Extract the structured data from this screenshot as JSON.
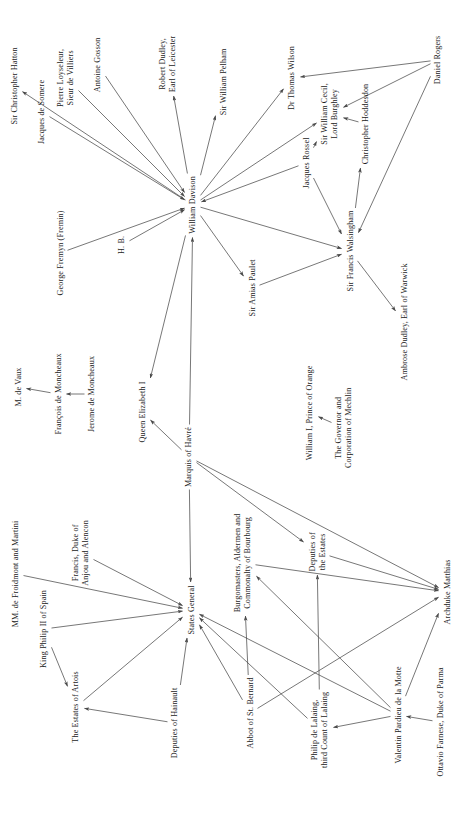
{
  "diagram": {
    "width": 470,
    "height": 816,
    "background": "#ffffff",
    "edge_color": "#4a4a4a",
    "text_color": "#1a1a1a",
    "label_rotation_deg": -90,
    "nodes": [
      {
        "id": "hatton",
        "label": "Sir Christopher Hatton",
        "x": 14,
        "y": 86
      },
      {
        "id": "somere",
        "label": "Jacques de Somere",
        "x": 42,
        "y": 112
      },
      {
        "id": "loyseleur",
        "label": "Pierre Loyseleur,\nSieur de Villiers",
        "x": 66,
        "y": 78
      },
      {
        "id": "gosson",
        "label": "Antoine Gosson",
        "x": 98,
        "y": 65
      },
      {
        "id": "leicester",
        "label": "Robert Dudley,\nEarl of Leicester",
        "x": 168,
        "y": 64
      },
      {
        "id": "pelham",
        "label": "Sir William Pelham",
        "x": 224,
        "y": 82
      },
      {
        "id": "wilson",
        "label": "Dr Thomas Wilson",
        "x": 292,
        "y": 78
      },
      {
        "id": "burghley",
        "label": "Sir William Cecil,\nLord Burghley",
        "x": 330,
        "y": 114
      },
      {
        "id": "hoddesdon",
        "label": "Christopher Hoddesdon",
        "x": 366,
        "y": 124
      },
      {
        "id": "rogers",
        "label": "Daniel Rogers",
        "x": 438,
        "y": 60
      },
      {
        "id": "rossel",
        "label": "Jacques Rossel",
        "x": 306,
        "y": 163
      },
      {
        "id": "davison",
        "label": "William Davison",
        "x": 193,
        "y": 205
      },
      {
        "id": "fremyn",
        "label": "George Fremyn (Fremin)",
        "x": 60,
        "y": 253
      },
      {
        "id": "hb",
        "label": "H. B.",
        "x": 122,
        "y": 245
      },
      {
        "id": "walsingham",
        "label": "Sir Francis Walsingham",
        "x": 350,
        "y": 251
      },
      {
        "id": "paulet",
        "label": "Sir Amias Paulet",
        "x": 252,
        "y": 288
      },
      {
        "id": "warwick",
        "label": "Ambrose Dudley, Earl of Warwick",
        "x": 404,
        "y": 322
      },
      {
        "id": "devaux",
        "label": "M. de Vaux",
        "x": 18,
        "y": 387
      },
      {
        "id": "francois",
        "label": "François de Moncheaux",
        "x": 58,
        "y": 394
      },
      {
        "id": "jerome",
        "label": "Jerome de Moncheaux",
        "x": 92,
        "y": 394
      },
      {
        "id": "elizabeth",
        "label": "Queen Elizabeth I",
        "x": 142,
        "y": 412
      },
      {
        "id": "orange",
        "label": "William I, Prince of Orange",
        "x": 310,
        "y": 413
      },
      {
        "id": "mechlin",
        "label": "The Governor and\nCorporation of Mechlin",
        "x": 344,
        "y": 428
      },
      {
        "id": "havre",
        "label": "Marquis of Havré",
        "x": 189,
        "y": 457
      },
      {
        "id": "froidmont",
        "label": "MM. de Froidmont and Martini",
        "x": 16,
        "y": 574
      },
      {
        "id": "anjou",
        "label": "Francis, Duke of\nAnjou and Alencon",
        "x": 81,
        "y": 553
      },
      {
        "id": "burgomasters",
        "label": "Burgomasters, Aldermen and\nCommonalty of Bourbourg",
        "x": 243,
        "y": 563
      },
      {
        "id": "depestates",
        "label": "Deputies of\nthe Estates",
        "x": 317,
        "y": 552
      },
      {
        "id": "philip2",
        "label": "King Philip II of Spain",
        "x": 44,
        "y": 629
      },
      {
        "id": "statesgen",
        "label": "States General",
        "x": 191,
        "y": 610
      },
      {
        "id": "matthias",
        "label": "Archduke Matthias",
        "x": 447,
        "y": 592
      },
      {
        "id": "artois",
        "label": "The Estates of Artois",
        "x": 76,
        "y": 707
      },
      {
        "id": "hainault",
        "label": "Deputies of Hainault",
        "x": 175,
        "y": 723
      },
      {
        "id": "stbernard",
        "label": "Abbot of St. Bernard",
        "x": 250,
        "y": 713
      },
      {
        "id": "lalaing",
        "label": "Philip de Lalaing,\nthird Count of Lalaing",
        "x": 320,
        "y": 730
      },
      {
        "id": "lamotte",
        "label": "Valentin Pardieu de la Motte",
        "x": 398,
        "y": 715
      },
      {
        "id": "farnese",
        "label": "Ottavio Farnese, Duke of Parma",
        "x": 440,
        "y": 722
      }
    ],
    "edges": [
      {
        "from": "davison",
        "to": "hatton"
      },
      {
        "from": "somere",
        "to": "davison"
      },
      {
        "from": "loyseleur",
        "to": "davison"
      },
      {
        "from": "gosson",
        "to": "davison"
      },
      {
        "from": "davison",
        "to": "leicester"
      },
      {
        "from": "davison",
        "to": "pelham"
      },
      {
        "from": "davison",
        "to": "wilson"
      },
      {
        "from": "davison",
        "to": "burghley"
      },
      {
        "from": "fremyn",
        "to": "davison"
      },
      {
        "from": "hb",
        "to": "davison"
      },
      {
        "from": "rossel",
        "to": "davison"
      },
      {
        "from": "rossel",
        "to": "burghley"
      },
      {
        "from": "rossel",
        "to": "walsingham"
      },
      {
        "from": "davison",
        "to": "walsingham"
      },
      {
        "from": "davison",
        "to": "paulet"
      },
      {
        "from": "paulet",
        "to": "walsingham"
      },
      {
        "from": "rogers",
        "to": "wilson"
      },
      {
        "from": "rogers",
        "to": "burghley"
      },
      {
        "from": "rogers",
        "to": "walsingham"
      },
      {
        "from": "hoddesdon",
        "to": "burghley"
      },
      {
        "from": "walsingham",
        "to": "hoddesdon"
      },
      {
        "from": "walsingham",
        "to": "warwick"
      },
      {
        "from": "francois",
        "to": "devaux"
      },
      {
        "from": "jerome",
        "to": "francois"
      },
      {
        "from": "davison",
        "to": "elizabeth"
      },
      {
        "from": "havre",
        "to": "elizabeth"
      },
      {
        "from": "havre",
        "to": "davison"
      },
      {
        "from": "mechlin",
        "to": "orange"
      },
      {
        "from": "havre",
        "to": "statesgen"
      },
      {
        "from": "havre",
        "to": "depestates"
      },
      {
        "from": "havre",
        "to": "matthias"
      },
      {
        "from": "froidmont",
        "to": "statesgen"
      },
      {
        "from": "anjou",
        "to": "statesgen"
      },
      {
        "from": "philip2",
        "to": "statesgen"
      },
      {
        "from": "philip2",
        "to": "artois"
      },
      {
        "from": "artois",
        "to": "statesgen"
      },
      {
        "from": "hainault",
        "to": "statesgen"
      },
      {
        "from": "hainault",
        "to": "artois"
      },
      {
        "from": "stbernard",
        "to": "statesgen"
      },
      {
        "from": "stbernard",
        "to": "burgomasters"
      },
      {
        "from": "lalaing",
        "to": "statesgen"
      },
      {
        "from": "lalaing",
        "to": "depestates"
      },
      {
        "from": "lamotte",
        "to": "statesgen"
      },
      {
        "from": "lamotte",
        "to": "burgomasters"
      },
      {
        "from": "lamotte",
        "to": "matthias"
      },
      {
        "from": "lamotte",
        "to": "lalaing"
      },
      {
        "from": "farnese",
        "to": "lamotte"
      },
      {
        "from": "depestates",
        "to": "matthias"
      },
      {
        "from": "stbernard",
        "to": "matthias"
      },
      {
        "from": "burgomasters",
        "to": "matthias"
      }
    ]
  }
}
